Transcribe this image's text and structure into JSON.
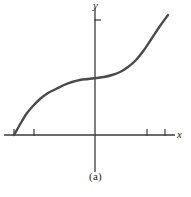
{
  "figure": {
    "caption": "(a)",
    "background_color": "#ffffff",
    "curve_color": "#4a4a4a",
    "axis_color": "#3a3a3a",
    "label_color": "#1a1a1a"
  },
  "axes": {
    "x_label": "x",
    "y_label": "y",
    "origin_px": {
      "x": 95,
      "y": 135
    },
    "x_axis_px": {
      "x1": 4,
      "y1": 135,
      "x2": 175,
      "y2": 135
    },
    "y_axis_px": {
      "x1": 95,
      "y1": 8,
      "x2": 95,
      "y2": 172
    },
    "x_ticks_px": [
      14,
      34,
      147,
      165
    ],
    "y_ticks_px": [
      20
    ]
  },
  "chart_data": {
    "type": "line",
    "title": "",
    "subtitle": "",
    "xlabel": "x",
    "ylabel": "y",
    "caption": "(a)",
    "grid": false,
    "legend": null,
    "axis_arrows": false,
    "xlim": [
      -4.5,
      4.4
    ],
    "ylim": [
      -1.9,
      3.2
    ],
    "x_tick_values": [
      -4,
      -3,
      2.6,
      3.5
    ],
    "y_tick_values": [
      2.7
    ],
    "x_tick_labels": [
      "",
      "",
      "",
      ""
    ],
    "y_tick_labels": [
      ""
    ],
    "series": [
      {
        "name": "cubic-like increasing curve with inflection at origin",
        "description": "Smooth monotonically increasing curve starting on the x-axis at the far left, rising steeply, flattening to a horizontal plateau just above the origin, then rising steeply again to the upper right.",
        "x": [
          -4.2,
          -4.0,
          -3.7,
          -3.4,
          -3.0,
          -2.6,
          -2.2,
          -1.8,
          -1.4,
          -1.0,
          -0.6,
          -0.2,
          0.2,
          0.6,
          1.0,
          1.4,
          1.8,
          2.2,
          2.6,
          3.0,
          3.4,
          3.7
        ],
        "y": [
          0.0,
          0.28,
          0.58,
          0.82,
          1.06,
          1.24,
          1.38,
          1.47,
          1.53,
          1.56,
          1.575,
          1.58,
          1.585,
          1.6,
          1.65,
          1.76,
          1.95,
          2.22,
          2.55,
          2.9,
          3.1,
          3.2
        ]
      }
    ],
    "points_px": [
      [
        14,
        135
      ],
      [
        18,
        128
      ],
      [
        22,
        121
      ],
      [
        27,
        113
      ],
      [
        33,
        106
      ],
      [
        40,
        99
      ],
      [
        48,
        93
      ],
      [
        56,
        89
      ],
      [
        64,
        85
      ],
      [
        72,
        82
      ],
      [
        80,
        80
      ],
      [
        88,
        79
      ],
      [
        96,
        78
      ],
      [
        104,
        77
      ],
      [
        112,
        75
      ],
      [
        120,
        72
      ],
      [
        128,
        67
      ],
      [
        136,
        60
      ],
      [
        144,
        50
      ],
      [
        152,
        38
      ],
      [
        160,
        26
      ],
      [
        168,
        15
      ]
    ]
  }
}
